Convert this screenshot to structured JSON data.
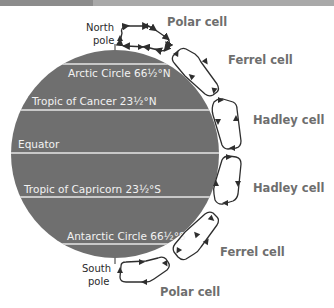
{
  "diagram": {
    "colors": {
      "earth": "#6f6f6f",
      "latitude_line": "#e6e6e6",
      "latitude_text": "#f2f2f2",
      "cell_outline": "#2e2e2e",
      "cell_label": "#6e6e6e",
      "pole_text": "#2a2a2a",
      "top_bar_dark": "#8c8c8c",
      "top_bar_light": "#a9a9a9"
    },
    "poles": {
      "north": {
        "line1": "North",
        "line2": "pole"
      },
      "south": {
        "line1": "South",
        "line2": "pole"
      }
    },
    "latitudes": [
      {
        "label": "Arctic Circle 66½°N"
      },
      {
        "label": "Tropic of Cancer 23½°N"
      },
      {
        "label": "Equator"
      },
      {
        "label": "Tropic of Capricorn 23½°S"
      },
      {
        "label": "Antarctic Circle 66½°S"
      }
    ],
    "cells": [
      {
        "label": "Polar cell",
        "hemisphere": "north"
      },
      {
        "label": "Ferrel cell",
        "hemisphere": "north"
      },
      {
        "label": "Hadley cell",
        "hemisphere": "north"
      },
      {
        "label": "Hadley cell",
        "hemisphere": "south"
      },
      {
        "label": "Ferrel cell",
        "hemisphere": "south"
      },
      {
        "label": "Polar cell",
        "hemisphere": "south"
      }
    ]
  }
}
